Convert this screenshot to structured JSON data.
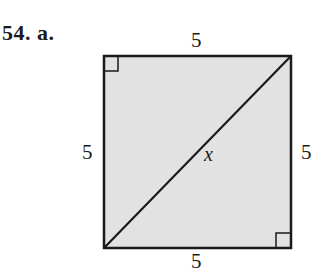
{
  "problem": {
    "number": "54.",
    "part": "a."
  },
  "figure": {
    "shape": "square",
    "fill_color": "#e2e2e2",
    "stroke_color": "#1a1a1a",
    "labels": {
      "top": "5",
      "left": "5",
      "right": "5",
      "bottom": "5",
      "diagonal": "x"
    },
    "right_angle_marks": [
      "top-left",
      "bottom-right"
    ]
  }
}
